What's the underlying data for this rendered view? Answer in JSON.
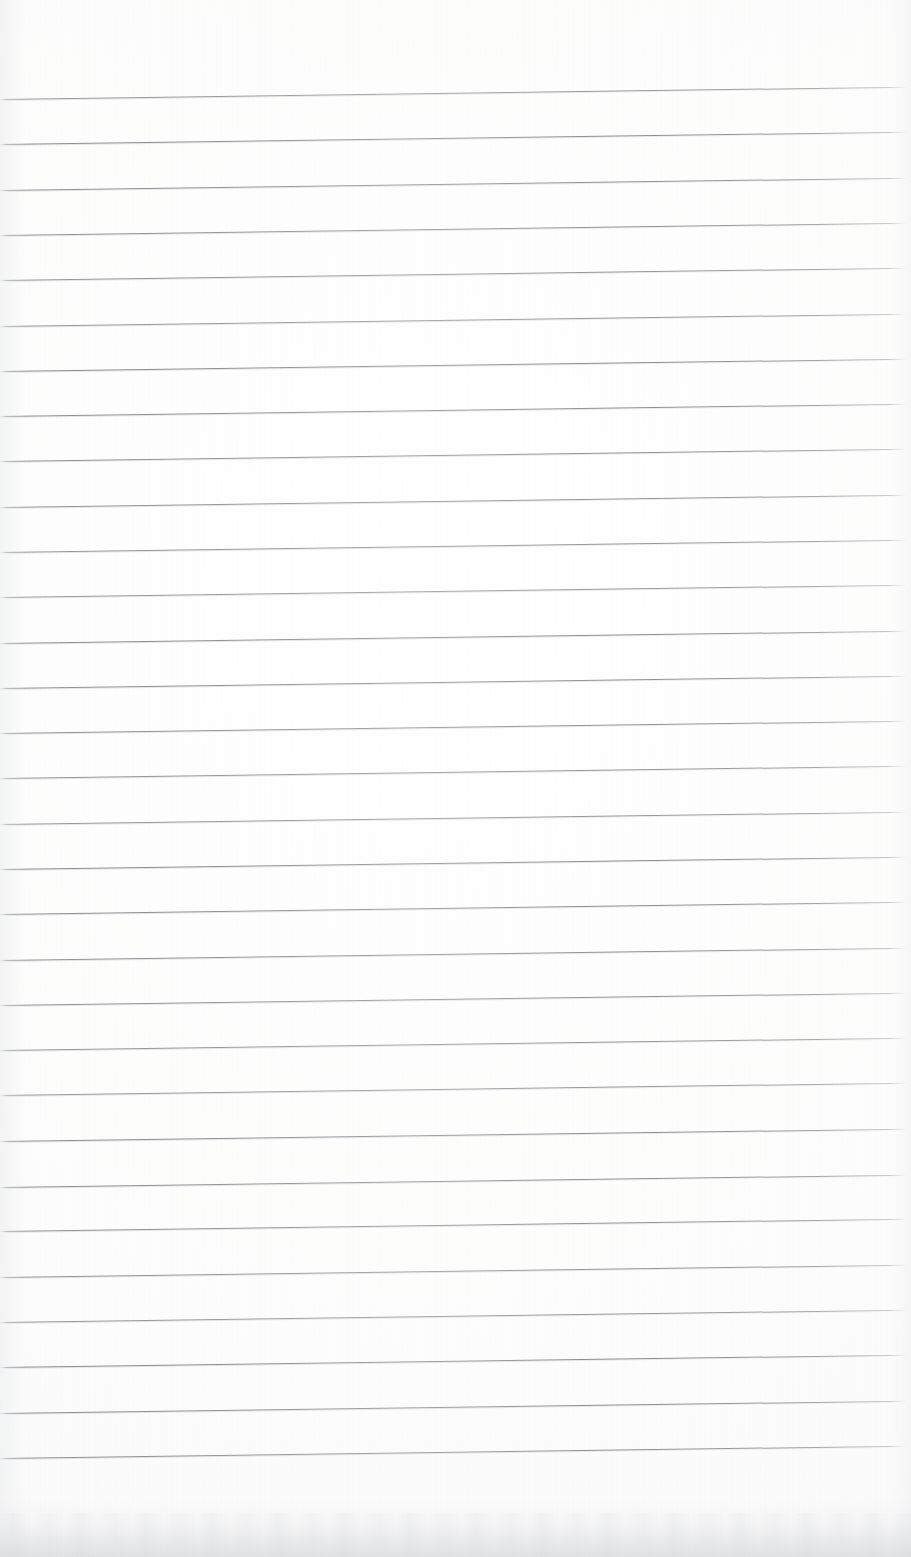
{
  "document": {
    "kind": "scanned-image",
    "subject": "blank ruled notebook paper",
    "orientation": "portrait",
    "width_px": 911,
    "height_px": 1557,
    "has_text_content": false,
    "written_content": "",
    "page_number_text": "",
    "heading_text": "",
    "margin_note_text": ""
  },
  "paper": {
    "background_color": "#fdfdfd",
    "background_color_edge": "#f7f7f8",
    "bottom_shadow_color": "#d6d7dc",
    "has_margin_rule": false,
    "has_holes": false,
    "has_header_line": false
  },
  "ruling": {
    "style": "horizontal-ruled",
    "line_color": "#86888e",
    "line_echo_color": "#b0b2b8",
    "line_thickness_px": 1,
    "line_count": 31,
    "spacing_px": 45.3,
    "first_line_y_px": 99,
    "last_line_y_px": 1457,
    "line_start_x_px": 0,
    "line_width_px": 906,
    "skew_degrees": -0.78,
    "top_margin_px": 99,
    "bottom_margin_px": 100,
    "line_y_positions": [
      99,
      144.3,
      189.6,
      234.9,
      280.2,
      325.5,
      370.8,
      416.1,
      461.4,
      506.7,
      552,
      597.3,
      642.6,
      687.9,
      733.2,
      778.5,
      823.8,
      869.1,
      914.4,
      959.7,
      1005,
      1050.3,
      1095.6,
      1140.9,
      1186.2,
      1231.5,
      1276.8,
      1322.1,
      1367.4,
      1412.7,
      1458
    ]
  }
}
